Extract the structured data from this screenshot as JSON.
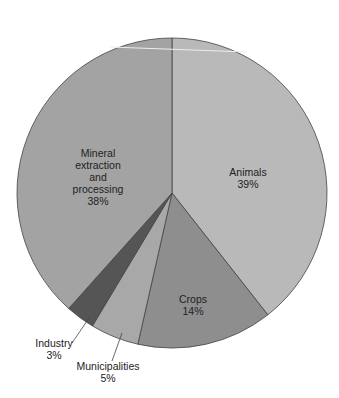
{
  "chart_data": {
    "type": "pie",
    "title": "",
    "start": "top",
    "direction": "clockwise",
    "slices": [
      {
        "label": "Animals",
        "value": 39,
        "pct_label": "39%",
        "color": "#b9b9b9"
      },
      {
        "label": "Crops",
        "value": 14,
        "pct_label": "14%",
        "color": "#8e8e8e"
      },
      {
        "label": "Municipalities",
        "value": 5,
        "pct_label": "5%",
        "color": "#a8a8a8"
      },
      {
        "label": "Industry",
        "value": 3,
        "pct_label": "3%",
        "color": "#555555"
      },
      {
        "label": "Mineral extraction and processing",
        "value": 38,
        "pct_label": "38%",
        "color": "#a3a3a3"
      }
    ],
    "labels": {
      "animals": [
        "Animals",
        "39%"
      ],
      "crops": [
        "Crops",
        "14%"
      ],
      "municipalities": [
        "Municipalities",
        "5%"
      ],
      "industry": [
        "Industry",
        "3%"
      ],
      "mineral": [
        "Mineral",
        "extraction",
        "and",
        "processing",
        "38%"
      ]
    }
  }
}
